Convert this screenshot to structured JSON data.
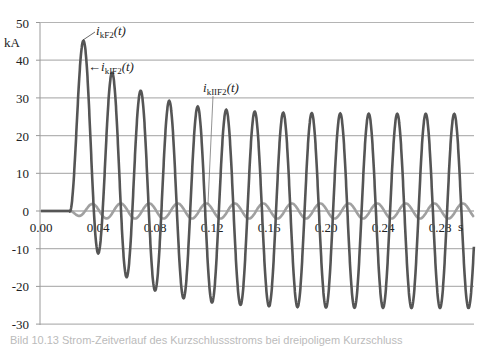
{
  "chart_data": {
    "type": "line",
    "title": "",
    "xlabel": "s",
    "ylabel": "kA",
    "xlim": [
      0.0,
      0.3
    ],
    "ylim": [
      -30,
      50
    ],
    "grid": "horizontal",
    "x_ticks": [
      "0.00",
      "0.04",
      "0.08",
      "0.12",
      "0.16",
      "0.20",
      "0.24",
      "0.28"
    ],
    "y_ticks": [
      "50",
      "40",
      "30",
      "20",
      "10",
      "0",
      "-10",
      "-20",
      "-30"
    ],
    "series": [
      {
        "name": "i_kF2(t)",
        "label_main": "i",
        "label_sub": "kF2",
        "label_tail": "(t)",
        "color": "#555555",
        "description": "asymmetric short-circuit current with decaying DC offset, fault at t=0.02 s, 50 Hz",
        "fault_time": 0.02,
        "ac_amplitude": 25.75,
        "dc_time_constant": 0.035,
        "peaks": [
          {
            "t": 0.03,
            "value": 45
          },
          {
            "t": 0.05,
            "value": 35.5
          },
          {
            "t": 0.07,
            "value": 31
          },
          {
            "t": 0.09,
            "value": 28.5
          },
          {
            "t": 0.11,
            "value": 27
          },
          {
            "t": 0.13,
            "value": 26.5
          },
          {
            "t": 0.29,
            "value": 25.8
          }
        ],
        "troughs": [
          {
            "t": 0.04,
            "value": -12
          },
          {
            "t": 0.06,
            "value": -18
          },
          {
            "t": 0.08,
            "value": -21.5
          },
          {
            "t": 0.1,
            "value": -23.5
          },
          {
            "t": 0.12,
            "value": -24.5
          },
          {
            "t": 0.14,
            "value": -25
          },
          {
            "t": 0.3,
            "value": -25.7
          }
        ]
      },
      {
        "name": "i_kIIF2(t)",
        "label_main": "i",
        "label_sub": "kIIF2",
        "label_tail": "(t)",
        "color": "#a0a0a0",
        "description": "small oscillating component, amplitude ~2 kA",
        "fault_time": 0.02,
        "amplitude": 2.0
      }
    ],
    "annotations": [
      {
        "text": "i_kF2(t)",
        "points_to": "first peak of i_kF2"
      },
      {
        "text": "i_kIF2(t)",
        "arrow": "left",
        "points_to": "first peak descending edge"
      },
      {
        "text": "i_kIIF2(t)",
        "leader": "vertical line down to small curve near t=0.12"
      }
    ]
  },
  "labels": {
    "unit_y": "kA",
    "unit_x": "s",
    "ann1": {
      "main": "i",
      "sub": "kF2",
      "tail": "(t)"
    },
    "ann2": {
      "arrow": "←",
      "main": "i",
      "sub": "kIF2",
      "tail": "(t)"
    },
    "ann3": {
      "main": "i",
      "sub": "kIIF2",
      "tail": "(t)"
    }
  },
  "caption": "Bild 10.13 Strom-Zeitverlauf des Kurzschlussstroms bei dreipoligem Kurzschluss"
}
